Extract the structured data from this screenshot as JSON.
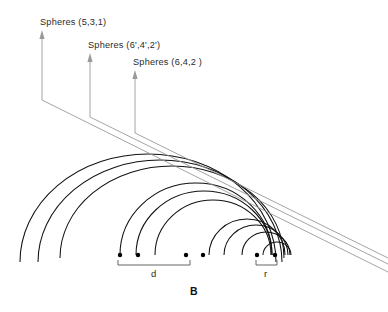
{
  "figure": {
    "panel_label": "B",
    "annotations": [
      {
        "name": "spheres-531",
        "text": "Spheres (5,3,1)",
        "x": 40,
        "y": 17,
        "arrow_x": 42,
        "arrow_tip_y": 30,
        "arrow_base_y": 100
      },
      {
        "name": "spheres-642-prime",
        "text": "Spheres  (6',4',2')",
        "x": 88,
        "y": 40,
        "arrow_x": 90,
        "arrow_tip_y": 53,
        "arrow_base_y": 117
      },
      {
        "name": "spheres-642",
        "text": "Spheres (6,4,2 )",
        "x": 133,
        "y": 57,
        "arrow_x": 135,
        "arrow_tip_y": 70,
        "arrow_base_y": 133
      }
    ],
    "leader_lines": [
      {
        "name": "leader-line-1",
        "x1": 42,
        "y1": 100,
        "x2": 388,
        "y2": 272
      },
      {
        "name": "leader-line-2",
        "x1": 90,
        "y1": 117,
        "x2": 388,
        "y2": 264
      },
      {
        "name": "leader-line-3",
        "x1": 135,
        "y1": 133,
        "x2": 388,
        "y2": 258
      }
    ],
    "baseline_y": 255,
    "dots": [
      {
        "name": "sphere-dot-1",
        "x": 120
      },
      {
        "name": "sphere-dot-2",
        "x": 138
      },
      {
        "name": "sphere-dot-3",
        "x": 186
      },
      {
        "name": "sphere-dot-4",
        "x": 203
      },
      {
        "name": "sphere-dot-5",
        "x": 257
      },
      {
        "name": "sphere-dot-6",
        "x": 275
      }
    ],
    "dimensions": [
      {
        "name": "dimension-d",
        "label": "d",
        "x1": 118,
        "x2": 190,
        "y": 265,
        "tick": 5,
        "label_x": 151,
        "label_y": 268
      },
      {
        "name": "dimension-r",
        "label": "r",
        "x1": 256,
        "x2": 277,
        "y": 265,
        "tick": 5,
        "label_x": 264,
        "label_y": 268
      }
    ],
    "arcs": [
      {
        "name": "arc-outer-1",
        "cx": 148,
        "cy": 262,
        "rx": 128,
        "ry": 108,
        "end_y": 262
      },
      {
        "name": "arc-outer-2",
        "cx": 160,
        "cy": 262,
        "rx": 122,
        "ry": 102,
        "end_y": 262
      },
      {
        "name": "arc-outer-3",
        "cx": 172,
        "cy": 258,
        "rx": 112,
        "ry": 92,
        "end_y": 258
      },
      {
        "name": "arc-mid-1",
        "cx": 196,
        "cy": 255,
        "rx": 76,
        "ry": 72,
        "end_y": 255
      },
      {
        "name": "arc-mid-2",
        "cx": 204,
        "cy": 255,
        "rx": 68,
        "ry": 64,
        "end_y": 255
      },
      {
        "name": "arc-mid-3",
        "cx": 213,
        "cy": 255,
        "rx": 58,
        "ry": 55,
        "end_y": 255
      },
      {
        "name": "arc-inner-1",
        "cx": 247,
        "cy": 255,
        "rx": 38,
        "ry": 36,
        "end_y": 255
      },
      {
        "name": "arc-inner-2",
        "cx": 256,
        "cy": 255,
        "rx": 32,
        "ry": 30,
        "end_y": 255
      },
      {
        "name": "arc-inner-3",
        "cx": 266,
        "cy": 255,
        "rx": 24,
        "ry": 23,
        "end_y": 255
      },
      {
        "name": "arc-small-1",
        "cx": 277,
        "cy": 255,
        "rx": 14,
        "ry": 13,
        "end_y": 255
      }
    ],
    "colors": {
      "arc_stroke": "#111111",
      "leader_stroke": "#9a9a9a",
      "dot_fill": "#000000",
      "dimension_stroke": "#555555",
      "text": "#2b2b2b"
    }
  }
}
